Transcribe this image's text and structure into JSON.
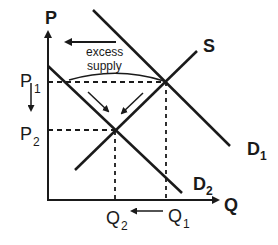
{
  "diagram": {
    "type": "supply-demand",
    "axes": {
      "y_label": "P",
      "x_label": "Q"
    },
    "curves": {
      "supply": {
        "label": "S"
      },
      "demand_1": {
        "label": "D",
        "subscript": "1"
      },
      "demand_2": {
        "label": "D",
        "subscript": "2"
      }
    },
    "prices": {
      "p1": {
        "label": "P",
        "subscript": "1"
      },
      "p2": {
        "label": "P",
        "subscript": "2"
      }
    },
    "quantities": {
      "q1": {
        "label": "Q",
        "subscript": "1"
      },
      "q2": {
        "label": "Q",
        "subscript": "2"
      }
    },
    "annotation": {
      "line1": "excess",
      "line2": "supply"
    },
    "colors": {
      "ink": "#1a1a1a",
      "background": "#ffffff"
    }
  }
}
